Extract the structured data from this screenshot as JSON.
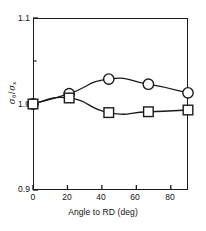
{
  "chart_data": {
    "type": "line",
    "title": "",
    "subtitle": "",
    "xlabel": "Angle to RD (deg)",
    "ylabel": "σθ / σx",
    "ylabel_parts": {
      "numerator_symbol": "σ",
      "numerator_subscript": "θ",
      "separator": "/",
      "denominator_symbol": "σ",
      "denominator_subscript": "x"
    },
    "xlim": [
      0,
      90
    ],
    "ylim": [
      0.9,
      1.1
    ],
    "xticks": [
      0,
      20,
      40,
      60,
      80
    ],
    "xtick_labels": [
      "0",
      "20",
      "40",
      "60",
      "80"
    ],
    "yticks": [
      0.9,
      1.0,
      1.1
    ],
    "ytick_labels": [
      "0.9",
      "1.0",
      "1.1"
    ],
    "yticks_minor": [
      1.05
    ],
    "grid": false,
    "legend": "none",
    "frame": "box",
    "series": [
      {
        "name": "circles",
        "marker": "circle",
        "marker_fill": "none",
        "marker_edge_color": "#1a1a1a",
        "line_color": "#1a1a1a",
        "x": [
          0,
          21,
          44,
          67,
          90
        ],
        "values": [
          1.0,
          1.012,
          1.029,
          1.023,
          1.013
        ]
      },
      {
        "name": "squares",
        "marker": "square",
        "marker_fill": "none",
        "marker_edge_color": "#1a1a1a",
        "line_color": "#1a1a1a",
        "x": [
          0,
          21,
          44,
          67,
          90
        ],
        "values": [
          1.0,
          1.007,
          0.99,
          0.991,
          0.993
        ]
      }
    ]
  },
  "axes": {
    "ytick_top": "1.1",
    "ytick_mid": "1.0",
    "ytick_bottom": "0.9",
    "xtick_0": "0",
    "xtick_20": "20",
    "xtick_40": "40",
    "xtick_60": "60",
    "xtick_80": "80",
    "x_axis_title": "Angle to RD (deg)",
    "y_numerator": "σ",
    "y_numerator_sub": "θ",
    "y_slash": "/",
    "y_denominator": "σ",
    "y_denominator_sub": "x"
  },
  "colors": {
    "line": "#1a1a1a",
    "frame": "#1a1a1a",
    "text": "#111111",
    "background": "#ffffff"
  }
}
